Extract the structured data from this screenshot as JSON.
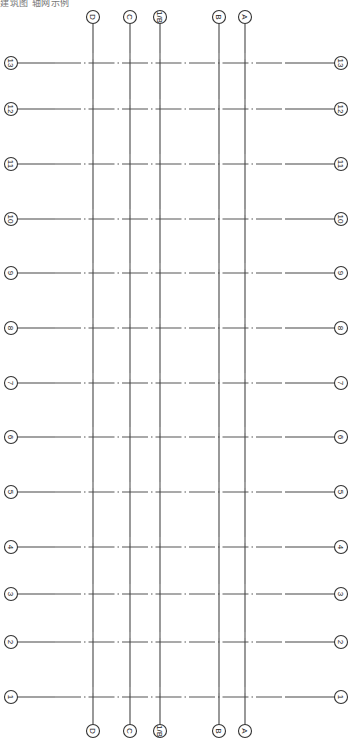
{
  "header": {
    "caption": "建筑图 轴网示例"
  },
  "drawing": {
    "type": "axis-grid",
    "orientation": "rotated-90",
    "line_color": "#444444",
    "columns": [
      {
        "label": "D",
        "x": 93
      },
      {
        "label": "C",
        "x": 130
      },
      {
        "label": "1/B",
        "x": 160
      },
      {
        "label": "B",
        "x": 219
      },
      {
        "label": "A",
        "x": 245
      }
    ],
    "rows": [
      {
        "label": "13",
        "y": 63
      },
      {
        "label": "12",
        "y": 109
      },
      {
        "label": "11",
        "y": 164
      },
      {
        "label": "10",
        "y": 219
      },
      {
        "label": "9",
        "y": 273
      },
      {
        "label": "8",
        "y": 328
      },
      {
        "label": "7",
        "y": 383
      },
      {
        "label": "6",
        "y": 437
      },
      {
        "label": "5",
        "y": 492
      },
      {
        "label": "4",
        "y": 547
      },
      {
        "label": "3",
        "y": 594
      },
      {
        "label": "2",
        "y": 642
      },
      {
        "label": "1",
        "y": 697
      }
    ],
    "top_bubble_y": 17,
    "bottom_bubble_y": 731,
    "left_bubble_x": 11,
    "right_bubble_x": 341,
    "bubble_radius": 6.5
  }
}
